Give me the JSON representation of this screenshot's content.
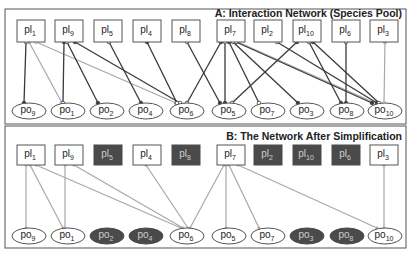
{
  "panel_a": {
    "title": "A: Interaction Network (Species Pool)",
    "plants": [
      {
        "id": "pl1",
        "base": "pl",
        "sub": "1",
        "x": 31
      },
      {
        "id": "pl9",
        "base": "pl",
        "sub": "9",
        "x": 69
      },
      {
        "id": "pl5",
        "base": "pl",
        "sub": "5",
        "x": 108
      },
      {
        "id": "pl4",
        "base": "pl",
        "sub": "4",
        "x": 147
      },
      {
        "id": "pl8",
        "base": "pl",
        "sub": "8",
        "x": 186
      },
      {
        "id": "pl7",
        "base": "pl",
        "sub": "7",
        "x": 231
      },
      {
        "id": "pl2",
        "base": "pl",
        "sub": "2",
        "x": 268
      },
      {
        "id": "pl10",
        "base": "pl",
        "sub": "10",
        "x": 307
      },
      {
        "id": "pl6",
        "base": "pl",
        "sub": "6",
        "x": 346
      },
      {
        "id": "pl3",
        "base": "pl",
        "sub": "3",
        "x": 384
      }
    ],
    "pollinators": [
      {
        "id": "po9",
        "base": "po",
        "sub": "9",
        "x": 29
      },
      {
        "id": "po1",
        "base": "po",
        "sub": "1",
        "x": 68
      },
      {
        "id": "po2",
        "base": "po",
        "sub": "2",
        "x": 107
      },
      {
        "id": "po4",
        "base": "po",
        "sub": "4",
        "x": 146
      },
      {
        "id": "po6",
        "base": "po",
        "sub": "6",
        "x": 187
      },
      {
        "id": "po5",
        "base": "po",
        "sub": "5",
        "x": 229
      },
      {
        "id": "po7",
        "base": "po",
        "sub": "7",
        "x": 268
      },
      {
        "id": "po3",
        "base": "po",
        "sub": "3",
        "x": 307
      },
      {
        "id": "po8",
        "base": "po",
        "sub": "8",
        "x": 347
      },
      {
        "id": "po10",
        "base": "po",
        "sub": "10",
        "x": 385
      }
    ],
    "edges": [
      {
        "from": "pl1",
        "to": "po9",
        "style": "dark",
        "fx": 26,
        "tx": 24
      },
      {
        "from": "pl1",
        "to": "po1",
        "style": "light",
        "fx": 29,
        "tx": 62
      },
      {
        "from": "pl1",
        "to": "po6",
        "style": "light",
        "fx": 36,
        "tx": 176
      },
      {
        "from": "pl9",
        "to": "po1",
        "style": "dark",
        "fx": 64,
        "tx": 63
      },
      {
        "from": "pl9",
        "to": "po2",
        "style": "dark",
        "fx": 67,
        "tx": 98
      },
      {
        "from": "pl9",
        "to": "po6",
        "style": "dark",
        "fx": 75,
        "tx": 180
      },
      {
        "from": "pl5",
        "to": "po4",
        "style": "dark",
        "fx": 109,
        "tx": 141
      },
      {
        "from": "pl4",
        "to": "po6",
        "style": "dark",
        "fx": 147,
        "tx": 177
      },
      {
        "from": "pl8",
        "to": "po5",
        "style": "dark",
        "fx": 187,
        "tx": 220
      },
      {
        "from": "pl7",
        "to": "po6",
        "style": "dark",
        "fx": 221,
        "tx": 187
      },
      {
        "from": "pl7",
        "to": "po5",
        "style": "dark",
        "fx": 225,
        "tx": 225
      },
      {
        "from": "pl7",
        "to": "po7",
        "style": "dark",
        "fx": 229,
        "tx": 259
      },
      {
        "from": "pl7",
        "to": "po3",
        "style": "dark",
        "fx": 233,
        "tx": 298
      },
      {
        "from": "pl7",
        "to": "po10",
        "style": "light",
        "fx": 238,
        "tx": 375
      },
      {
        "from": "pl2",
        "to": "po10",
        "style": "dark",
        "fx": 277,
        "tx": 377
      },
      {
        "from": "pl10",
        "to": "po5",
        "style": "dark",
        "fx": 297,
        "tx": 232
      },
      {
        "from": "pl10",
        "to": "po8",
        "style": "dark",
        "fx": 309,
        "tx": 341
      },
      {
        "from": "pl10",
        "to": "po10",
        "style": "dark",
        "fx": 313,
        "tx": 379
      },
      {
        "from": "pl6",
        "to": "po8",
        "style": "dark",
        "fx": 346,
        "tx": 346
      },
      {
        "from": "pl3",
        "to": "po10",
        "style": "light",
        "fx": 385,
        "tx": 384
      },
      {
        "from": "pl7",
        "to": "po10b",
        "style": "dark",
        "fx": 236,
        "tx": 372
      }
    ]
  },
  "panel_b": {
    "title": "B: The Network After Simplification",
    "plants": [
      {
        "id": "pl1",
        "base": "pl",
        "sub": "1",
        "x": 31,
        "removed": false
      },
      {
        "id": "pl9",
        "base": "pl",
        "sub": "9",
        "x": 69,
        "removed": false
      },
      {
        "id": "pl5",
        "base": "pl",
        "sub": "5",
        "x": 108,
        "removed": true
      },
      {
        "id": "pl4",
        "base": "pl",
        "sub": "4",
        "x": 147,
        "removed": false
      },
      {
        "id": "pl8",
        "base": "pl",
        "sub": "8",
        "x": 186,
        "removed": true
      },
      {
        "id": "pl7",
        "base": "pl",
        "sub": "7",
        "x": 231,
        "removed": false
      },
      {
        "id": "pl2",
        "base": "pl",
        "sub": "2",
        "x": 268,
        "removed": true
      },
      {
        "id": "pl10",
        "base": "pl",
        "sub": "10",
        "x": 307,
        "removed": true
      },
      {
        "id": "pl6",
        "base": "pl",
        "sub": "6",
        "x": 346,
        "removed": true
      },
      {
        "id": "pl3",
        "base": "pl",
        "sub": "3",
        "x": 384,
        "removed": false
      }
    ],
    "pollinators": [
      {
        "id": "po9",
        "base": "po",
        "sub": "9",
        "x": 29,
        "removed": false
      },
      {
        "id": "po1",
        "base": "po",
        "sub": "1",
        "x": 68,
        "removed": false
      },
      {
        "id": "po2",
        "base": "po",
        "sub": "2",
        "x": 107,
        "removed": true
      },
      {
        "id": "po4",
        "base": "po",
        "sub": "4",
        "x": 146,
        "removed": true
      },
      {
        "id": "po6",
        "base": "po",
        "sub": "6",
        "x": 187,
        "removed": false
      },
      {
        "id": "po5",
        "base": "po",
        "sub": "5",
        "x": 229,
        "removed": false
      },
      {
        "id": "po7",
        "base": "po",
        "sub": "7",
        "x": 268,
        "removed": false
      },
      {
        "id": "po3",
        "base": "po",
        "sub": "3",
        "x": 307,
        "removed": true
      },
      {
        "id": "po8",
        "base": "po",
        "sub": "8",
        "x": 347,
        "removed": true
      },
      {
        "id": "po10",
        "base": "po",
        "sub": "10",
        "x": 385,
        "removed": false
      }
    ],
    "edges": [
      {
        "from": "pl1",
        "to": "po9",
        "fx": 26,
        "tx": 26
      },
      {
        "from": "pl1",
        "to": "po1",
        "fx": 30,
        "tx": 63
      },
      {
        "from": "pl1",
        "to": "po6",
        "fx": 36,
        "tx": 181
      },
      {
        "from": "pl9",
        "to": "po1",
        "fx": 65,
        "tx": 65
      },
      {
        "from": "pl9",
        "to": "po6",
        "fx": 74,
        "tx": 183
      },
      {
        "from": "pl4",
        "to": "po6",
        "fx": 146,
        "tx": 188
      },
      {
        "from": "pl7",
        "to": "po6",
        "fx": 224,
        "tx": 190
      },
      {
        "from": "pl7",
        "to": "po5",
        "fx": 226,
        "tx": 226
      },
      {
        "from": "pl7",
        "to": "po7",
        "fx": 229,
        "tx": 259
      },
      {
        "from": "pl7",
        "to": "po10",
        "fx": 238,
        "tx": 377
      },
      {
        "from": "pl3",
        "to": "po10",
        "fx": 384,
        "tx": 384
      }
    ]
  },
  "colors": {
    "dark_edge": "#3a3a3a",
    "light_edge": "#a8a8a8",
    "removed_fill": "#4a4a4a",
    "border": "#555555"
  }
}
